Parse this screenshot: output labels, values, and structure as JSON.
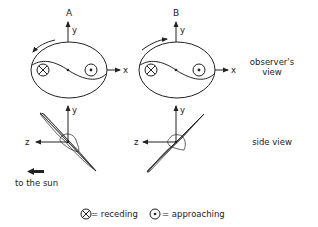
{
  "diagram": {
    "panels": [
      {
        "id": "A",
        "label": "A",
        "rotation": "counter-clockwise"
      },
      {
        "id": "B",
        "label": "B",
        "rotation": "clockwise"
      }
    ],
    "axes": {
      "x": "x",
      "y": "y",
      "z": "z"
    },
    "row_labels": {
      "observer_view_line1": "observer's",
      "observer_view_line2": "view",
      "side_view": "side view"
    },
    "sun_direction_label": "to the sun",
    "legend": {
      "receding_symbol": "⊗",
      "receding_label": "= receding",
      "approaching_symbol": "⊙",
      "approaching_label": "= approaching"
    },
    "colors": {
      "ink": "#222222",
      "background": "#ffffff"
    }
  }
}
